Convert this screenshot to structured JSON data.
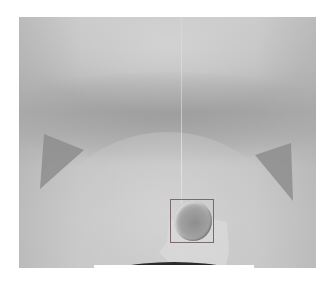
{
  "image": {
    "description": "Grayscale scientific/medical scan with a rectangular bounding-box annotation around a circular object",
    "palette": {
      "background": "#ffffff",
      "frame_base": "#c4c4c4",
      "dark_band": "#a9a9a9",
      "shadow_regions": "#8a8a8a",
      "bbox_stroke": "#7a6a6a",
      "sphere_core": "#8e8e8e",
      "bottom_arc": "#2a2a2a"
    },
    "annotation": {
      "type": "bounding-box",
      "target": "circular-object"
    }
  }
}
